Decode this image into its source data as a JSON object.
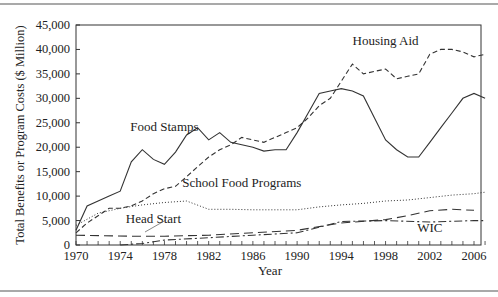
{
  "chart_data": {
    "type": "line",
    "title": "",
    "xlabel": "Year",
    "ylabel": "Total Benefits or Program Costs ($ Million)",
    "xlim": [
      1970,
      2007
    ],
    "ylim": [
      0,
      45000
    ],
    "x_ticks": [
      1970,
      1974,
      1978,
      1982,
      1986,
      1990,
      1994,
      1998,
      2002,
      2006
    ],
    "y_ticks": [
      0,
      5000,
      10000,
      15000,
      20000,
      25000,
      30000,
      35000,
      40000,
      45000
    ],
    "y_tick_labels": [
      "0",
      "5,000",
      "10,000",
      "15,000",
      "20,000",
      "25,000",
      "30,000",
      "35,000",
      "40,000",
      "45,000"
    ],
    "grid": false,
    "legend": "inline labels",
    "series": [
      {
        "name": "Food Stamps",
        "style": "solid",
        "x": [
          1970,
          1971,
          1972,
          1973,
          1974,
          1975,
          1976,
          1977,
          1978,
          1979,
          1980,
          1981,
          1982,
          1983,
          1984,
          1985,
          1986,
          1987,
          1988,
          1989,
          1990,
          1991,
          1992,
          1993,
          1994,
          1995,
          1996,
          1997,
          1998,
          1999,
          2000,
          2001,
          2002,
          2003,
          2004,
          2005,
          2006,
          2007
        ],
        "values": [
          3000,
          8000,
          9000,
          10000,
          11000,
          17000,
          19500,
          17500,
          16500,
          19000,
          22500,
          24000,
          21500,
          23000,
          21000,
          20500,
          20000,
          19200,
          19500,
          19500,
          23000,
          27000,
          31000,
          31500,
          32000,
          31500,
          30500,
          26000,
          21500,
          19500,
          18000,
          18000,
          21000,
          24000,
          27000,
          30000,
          31000,
          30000
        ],
        "label": "Food Stamps",
        "label_pos": [
          1978,
          23300
        ]
      },
      {
        "name": "Housing Aid",
        "style": "dashed",
        "x": [
          1970,
          1971,
          1972,
          1973,
          1974,
          1975,
          1976,
          1977,
          1978,
          1979,
          1980,
          1981,
          1982,
          1983,
          1984,
          1985,
          1986,
          1987,
          1988,
          1989,
          1990,
          1991,
          1992,
          1993,
          1994,
          1995,
          1996,
          1997,
          1998,
          1999,
          2000,
          2001,
          2002,
          2003,
          2004,
          2005,
          2006,
          2007
        ],
        "values": [
          2500,
          4500,
          6000,
          7500,
          7500,
          8000,
          9000,
          10500,
          11500,
          12000,
          14000,
          16000,
          18000,
          19500,
          20500,
          22000,
          21500,
          21000,
          22000,
          23000,
          24000,
          26000,
          28500,
          30000,
          33500,
          37000,
          35000,
          35500,
          36000,
          34000,
          34500,
          35000,
          39000,
          40000,
          40000,
          39500,
          38500,
          39000
        ],
        "label": "Housing Aid",
        "label_pos": [
          1998,
          41000
        ]
      },
      {
        "name": "School Food Programs",
        "style": "dotted",
        "x": [
          1970,
          1972,
          1974,
          1976,
          1978,
          1980,
          1982,
          1984,
          1986,
          1988,
          1990,
          1992,
          1994,
          1996,
          1998,
          2000,
          2002,
          2004,
          2006,
          2007
        ],
        "values": [
          4000,
          6500,
          7500,
          8200,
          8700,
          9000,
          7300,
          7300,
          7200,
          7200,
          7200,
          7800,
          8200,
          8500,
          9000,
          9200,
          9700,
          10200,
          10500,
          10800
        ],
        "label": "School Food Programs",
        "label_pos": [
          1985,
          11800
        ]
      },
      {
        "name": "Head Start",
        "style": "long-dash",
        "x": [
          1970,
          1975,
          1978,
          1982,
          1986,
          1990,
          1994,
          1998,
          2000,
          2002,
          2004,
          2006
        ],
        "values": [
          2000,
          1800,
          1800,
          2000,
          2500,
          3000,
          4500,
          5200,
          6000,
          7000,
          7300,
          7100
        ],
        "label": "Head Start",
        "label_pos": [
          1977,
          4600
        ]
      },
      {
        "name": "WIC",
        "style": "dash-dot",
        "x": [
          1974,
          1976,
          1978,
          1982,
          1986,
          1990,
          1994,
          1998,
          2002,
          2006,
          2007
        ],
        "values": [
          0,
          300,
          1000,
          1500,
          2000,
          2500,
          4800,
          5000,
          4700,
          5000,
          5000
        ],
        "label": "WIC",
        "label_pos": [
          2002,
          2600
        ]
      }
    ]
  }
}
